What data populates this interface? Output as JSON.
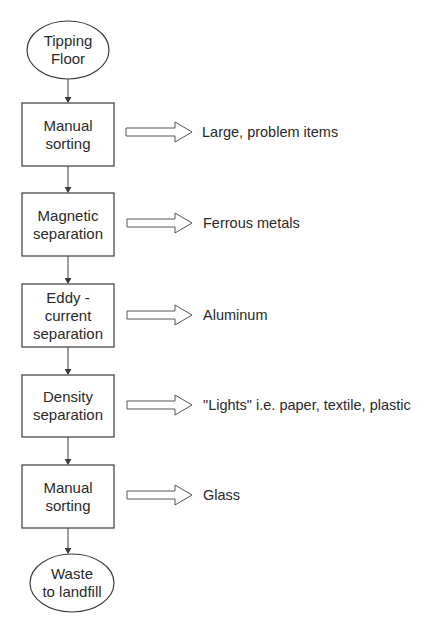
{
  "diagram": {
    "type": "flowchart",
    "start": {
      "label": "Tipping\nFloor"
    },
    "steps": [
      {
        "label": "Manual\nsorting",
        "output": "Large, problem items"
      },
      {
        "label": "Magnetic\nseparation",
        "output": "Ferrous metals"
      },
      {
        "label": "Eddy -\ncurrent\nseparation",
        "output": "Aluminum"
      },
      {
        "label": "Density\nseparation",
        "output": "\"Lights\" i.e. paper, textile, plastic"
      },
      {
        "label": "Manual\nsorting",
        "output": "Glass"
      }
    ],
    "end": {
      "label": "Waste\nto landfill"
    }
  },
  "colors": {
    "stroke": "#3a3a3a",
    "text": "#2a2a2a",
    "background": "#ffffff"
  }
}
